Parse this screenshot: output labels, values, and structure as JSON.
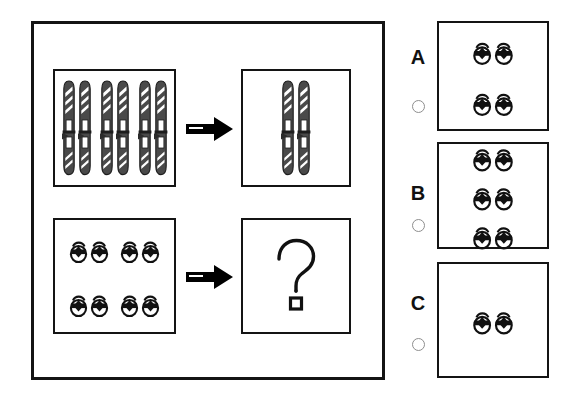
{
  "puzzle": {
    "type": "visual-analogy-pairs",
    "title_text": "",
    "question_symbol": "?",
    "arrow_symbol": "→",
    "rows": [
      {
        "id": "row-skis",
        "source": {
          "item": "ski",
          "item_label": "ski",
          "total_items": 6,
          "pairs": 3,
          "arrangement": "single-row-of-3-pairs"
        },
        "result": {
          "item": "ski",
          "item_label": "ski",
          "total_items": 2,
          "pairs": 1,
          "arrangement": "single-pair"
        }
      },
      {
        "id": "row-shoes",
        "source": {
          "item": "shoe",
          "item_label": "baby shoe",
          "total_items": 8,
          "pairs": 4,
          "arrangement": "2x2-grid-of-pairs"
        },
        "result": {
          "item": "question-mark",
          "item_label": "unknown",
          "total_items": 0,
          "pairs": 0,
          "arrangement": "question-mark"
        }
      }
    ]
  },
  "options": [
    {
      "letter": "A",
      "item": "shoe",
      "pairs": 2,
      "total_items": 4,
      "columns": 1,
      "selected": false
    },
    {
      "letter": "B",
      "item": "shoe",
      "pairs": 3,
      "total_items": 6,
      "columns": 1,
      "selected": false
    },
    {
      "letter": "C",
      "item": "shoe",
      "pairs": 1,
      "total_items": 2,
      "columns": 1,
      "selected": false
    }
  ],
  "colors": {
    "background": "#ffffff",
    "outline": "#141414",
    "ski_body": "#4a4a4a",
    "ski_highlight": "#ffffff",
    "shoe": "#111111",
    "arrow": "#000000",
    "radio_border": "#8e8e8e"
  }
}
